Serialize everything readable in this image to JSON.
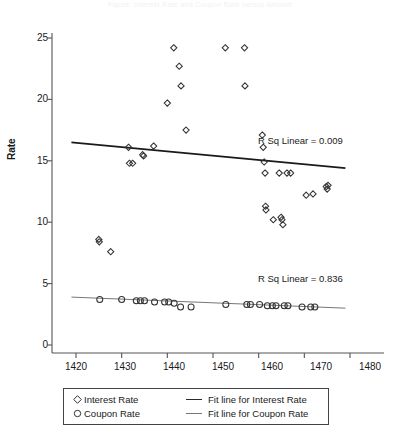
{
  "figure": {
    "faint_top_text": "Figure: Interest Rate and Coupon Rate versus Amount",
    "background_color": "#ffffff"
  },
  "axes": {
    "y_title": "Rate",
    "y_ticks": [
      "0",
      "5",
      "10",
      "15",
      "20",
      "25"
    ],
    "x_ticks": [
      "1420",
      "1430",
      "1440",
      "1450",
      "1460",
      "1470",
      "1480"
    ]
  },
  "annotations": {
    "interest_rsq": "R Sq Linear = 0.009",
    "coupon_rsq": "R Sq Linear = 0.836"
  },
  "legend": {
    "rows": [
      {
        "marker": "diamond-marker",
        "label": "Interest Rate",
        "line_label": "Fit line for Interest Rate",
        "line_name": "fit-line-interest-swatch"
      },
      {
        "marker": "circle-marker",
        "label": "Coupon Rate",
        "line_label": "Fit line for Coupon Rate",
        "line_name": "fit-line-coupon-swatch"
      }
    ]
  },
  "colors": {
    "marker_stroke": "#333333",
    "interest_fit_line": "#1a1a1a",
    "coupon_fit_line": "#777777",
    "axis": "#555555"
  },
  "chart_data": {
    "type": "scatter",
    "title": "",
    "xlabel": "",
    "ylabel": "Rate",
    "xlim": [
      1415,
      1483
    ],
    "ylim": [
      0,
      26.5
    ],
    "grid": false,
    "legend_position": "bottom",
    "series": [
      {
        "name": "Interest Rate",
        "marker": "diamond",
        "points": [
          [
            1425.0,
            8.6
          ],
          [
            1425.1,
            8.4
          ],
          [
            1427.6,
            7.6
          ],
          [
            1431.5,
            16.1
          ],
          [
            1431.7,
            14.8
          ],
          [
            1432.4,
            14.8
          ],
          [
            1434.6,
            15.5
          ],
          [
            1434.8,
            15.4
          ],
          [
            1437.0,
            16.2
          ],
          [
            1440.0,
            19.7
          ],
          [
            1441.4,
            24.2
          ],
          [
            1442.6,
            22.7
          ],
          [
            1443.0,
            21.1
          ],
          [
            1444.1,
            17.5
          ],
          [
            1452.7,
            24.2
          ],
          [
            1456.9,
            24.2
          ],
          [
            1457.0,
            21.1
          ],
          [
            1460.8,
            17.1
          ],
          [
            1461.0,
            16.1
          ],
          [
            1461.2,
            14.9
          ],
          [
            1461.4,
            14.0
          ],
          [
            1461.5,
            11.3
          ],
          [
            1461.6,
            11.0
          ],
          [
            1463.2,
            10.2
          ],
          [
            1464.5,
            14.0
          ],
          [
            1464.9,
            10.4
          ],
          [
            1465.1,
            10.2
          ],
          [
            1465.3,
            9.8
          ],
          [
            1466.2,
            14.0
          ],
          [
            1467.0,
            14.0
          ],
          [
            1470.4,
            12.2
          ],
          [
            1471.9,
            12.3
          ],
          [
            1474.8,
            12.9
          ],
          [
            1475.0,
            12.7
          ],
          [
            1475.2,
            13.0
          ]
        ]
      },
      {
        "name": "Coupon Rate",
        "marker": "circle",
        "points": [
          [
            1425.2,
            3.7
          ],
          [
            1430.0,
            3.7
          ],
          [
            1433.2,
            3.6
          ],
          [
            1434.1,
            3.6
          ],
          [
            1435.0,
            3.6
          ],
          [
            1437.2,
            3.5
          ],
          [
            1439.4,
            3.5
          ],
          [
            1440.3,
            3.5
          ],
          [
            1441.5,
            3.4
          ],
          [
            1442.9,
            3.1
          ],
          [
            1445.2,
            3.1
          ],
          [
            1452.8,
            3.3
          ],
          [
            1457.4,
            3.3
          ],
          [
            1458.2,
            3.3
          ],
          [
            1460.2,
            3.3
          ],
          [
            1461.9,
            3.2
          ],
          [
            1463.0,
            3.2
          ],
          [
            1463.8,
            3.2
          ],
          [
            1465.6,
            3.2
          ],
          [
            1466.4,
            3.2
          ],
          [
            1469.5,
            3.1
          ],
          [
            1471.4,
            3.1
          ],
          [
            1472.3,
            3.1
          ]
        ]
      }
    ],
    "fit_lines": [
      {
        "name": "Fit line for Interest Rate",
        "for_series": "Interest Rate",
        "x": [
          1419.0,
          1479.0
        ],
        "y": [
          16.5,
          14.4
        ],
        "r_squared": 0.009
      },
      {
        "name": "Fit line for Coupon Rate",
        "for_series": "Coupon Rate",
        "x": [
          1419.0,
          1479.0
        ],
        "y": [
          3.9,
          3.0
        ],
        "r_squared": 0.836
      }
    ]
  }
}
